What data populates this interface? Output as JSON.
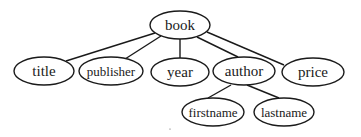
{
  "diagram": {
    "type": "tree",
    "root": "book",
    "nodes": [
      {
        "id": "book",
        "label": "book"
      },
      {
        "id": "title",
        "label": "title"
      },
      {
        "id": "publisher",
        "label": "publisher"
      },
      {
        "id": "year",
        "label": "year"
      },
      {
        "id": "author",
        "label": "author"
      },
      {
        "id": "price",
        "label": "price"
      },
      {
        "id": "firstname",
        "label": "firstname"
      },
      {
        "id": "lastname",
        "label": "lastname"
      }
    ],
    "edges": [
      {
        "from": "book",
        "to": "title"
      },
      {
        "from": "book",
        "to": "publisher"
      },
      {
        "from": "book",
        "to": "year"
      },
      {
        "from": "book",
        "to": "author"
      },
      {
        "from": "book",
        "to": "price"
      },
      {
        "from": "author",
        "to": "firstname"
      },
      {
        "from": "author",
        "to": "lastname"
      }
    ]
  }
}
